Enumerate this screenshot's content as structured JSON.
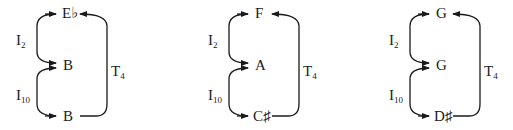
{
  "diagrams": [
    {
      "notes": {
        "top": "E♭",
        "middle": "B",
        "bottom": "B"
      },
      "labels": {
        "upper_op": "I",
        "upper_sub": "2",
        "lower_op": "I",
        "lower_sub": "10",
        "right_op": "T",
        "right_sub": "4"
      }
    },
    {
      "notes": {
        "top": "F",
        "middle": "A",
        "bottom": "C♯"
      },
      "labels": {
        "upper_op": "I",
        "upper_sub": "2",
        "lower_op": "I",
        "lower_sub": "10",
        "right_op": "T",
        "right_sub": "4"
      }
    },
    {
      "notes": {
        "top": "G",
        "middle": "G",
        "bottom": "D♯"
      },
      "labels": {
        "upper_op": "I",
        "upper_sub": "2",
        "lower_op": "I",
        "lower_sub": "10",
        "right_op": "T",
        "right_sub": "4"
      }
    }
  ]
}
